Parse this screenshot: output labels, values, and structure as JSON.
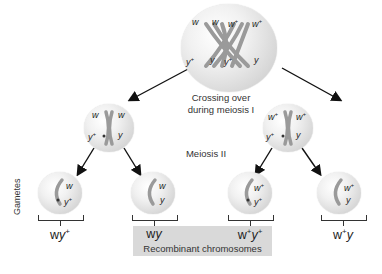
{
  "diagram": {
    "type": "meiosis-recombination",
    "top_cell": {
      "top_labels": [
        "w",
        "w",
        "w+",
        "w+"
      ],
      "bottom_labels": [
        "y+",
        "y",
        "y+",
        "y"
      ]
    },
    "meiosis1_caption_line1": "Crossing over",
    "meiosis1_caption_line2": "during meiosis I",
    "meiosis2_caption": "Meiosis II",
    "left_mid_cell": {
      "top_left": "w",
      "top_right": "w",
      "bottom_left": "y+",
      "bottom_right": "y"
    },
    "right_mid_cell": {
      "top_left": "w+",
      "top_right": "w+",
      "bottom_left": "y+",
      "bottom_right": "y"
    },
    "gametes_label": "Gametes",
    "gametes": [
      {
        "top": "w",
        "bottom": "y+",
        "genotype_base1": "wy",
        "genotype_sup1": "+",
        "genotype_mid": "",
        "genotype_sup2": ""
      },
      {
        "top": "w",
        "bottom": "y",
        "genotype_base1": "wy",
        "genotype_sup1": "",
        "genotype_mid": "",
        "genotype_sup2": ""
      },
      {
        "top": "w+",
        "bottom": "y+",
        "genotype_base1": "w",
        "genotype_sup1": "+",
        "genotype_mid": "y",
        "genotype_sup2": "+"
      },
      {
        "top": "w+",
        "bottom": "y",
        "genotype_base1": "w",
        "genotype_sup1": "+",
        "genotype_mid": "y",
        "genotype_sup2": ""
      }
    ],
    "recombinant_label": "Recombinant chromosomes",
    "colors": {
      "cell_fill": "#e6e6e6",
      "chromosome": "#9a9a9a",
      "recombinant_box": "#d9d9d9",
      "arrow": "#111111"
    }
  }
}
